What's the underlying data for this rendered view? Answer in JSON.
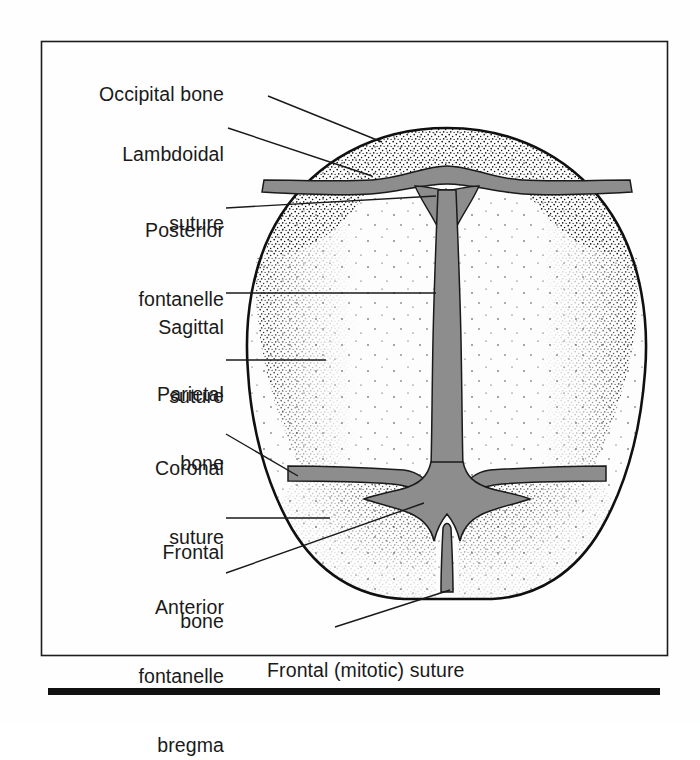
{
  "figure": {
    "kind": "anatomical-illustration",
    "frame_border_color": "#1d1d1d",
    "rule_color": "#111111",
    "background_color": "#fefefe",
    "bone_fill_color": "#fdfdfd",
    "suture_fill_color": "#8d8d8d",
    "outline_color": "#101010",
    "stipple_color": "#1a1a1a",
    "leader_line_color": "#1a1a1a"
  },
  "labels": {
    "occipital_bone": "Occipital bone",
    "lambdoidal_suture_line1": "Lambdoidal",
    "lambdoidal_suture_line2": "suture",
    "posterior_fontanelle_line1": "Posterior",
    "posterior_fontanelle_line2": "fontanelle",
    "sagittal_suture_line1": "Sagittal",
    "sagittal_suture_line2": "suture",
    "parietal_bone_line1": "Parietal",
    "parietal_bone_line2": "bone",
    "coronal_suture_line1": "Coronal",
    "coronal_suture_line2": "suture",
    "frontal_bone_line1": "Frontal",
    "frontal_bone_line2": "bone",
    "anterior_fontanelle_line1": "Anterior",
    "anterior_fontanelle_line2": "fontanelle",
    "anterior_fontanelle_line3": "bregma",
    "frontal_mitotic_suture": "Frontal (mitotic) suture"
  },
  "parts": [
    {
      "name": "Occipital bone",
      "type": "bone",
      "position": "posterior (top)"
    },
    {
      "name": "Lambdoidal suture",
      "type": "suture",
      "position": "between occipital and parietal bones"
    },
    {
      "name": "Posterior fontanelle",
      "type": "fontanelle",
      "position": "junction of sagittal and lambdoidal sutures"
    },
    {
      "name": "Sagittal suture",
      "type": "suture",
      "position": "midline between parietal bones"
    },
    {
      "name": "Parietal bone",
      "type": "bone",
      "position": "lateral, paired"
    },
    {
      "name": "Coronal suture",
      "type": "suture",
      "position": "between frontal and parietal bones"
    },
    {
      "name": "Frontal bone",
      "type": "bone",
      "position": "anterior (bottom), paired"
    },
    {
      "name": "Anterior fontanelle bregma",
      "type": "fontanelle",
      "position": "junction of coronal, sagittal and frontal sutures"
    },
    {
      "name": "Frontal (mitotic) suture",
      "type": "suture",
      "position": "midline between frontal bones"
    }
  ]
}
